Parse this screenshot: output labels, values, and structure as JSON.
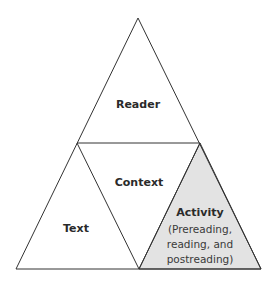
{
  "diagram": {
    "type": "triangle-model",
    "regions": [
      {
        "id": "reader",
        "label": "Reader"
      },
      {
        "id": "context",
        "label": "Context"
      },
      {
        "id": "text",
        "label": "Text"
      },
      {
        "id": "activity",
        "label": "Activity",
        "sublines": [
          "(Prereading,",
          "reading, and",
          "postreading)"
        ],
        "highlighted": true
      }
    ],
    "colors": {
      "stroke": "#333333",
      "highlight_fill": "#e3e3e3",
      "background": "#ffffff"
    }
  }
}
